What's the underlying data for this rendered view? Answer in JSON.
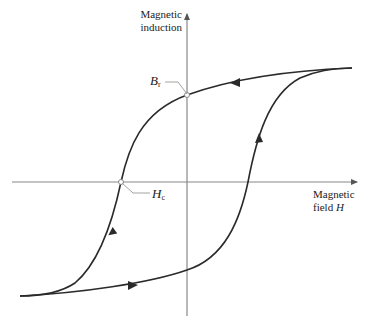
{
  "diagram": {
    "type": "hysteresis-loop",
    "y_axis_label_line1": "Magnetic",
    "y_axis_label_line2": "induction",
    "x_axis_label_line1": "Magnetic",
    "x_axis_label_line2": "field",
    "x_axis_symbol": "H",
    "remanence_label": "B",
    "remanence_subscript": "r",
    "coercivity_label": "H",
    "coercivity_subscript": "c",
    "colors": {
      "curve": "#2a2a2a",
      "axis": "#888888",
      "leader": "#999999",
      "text": "#222222"
    }
  }
}
